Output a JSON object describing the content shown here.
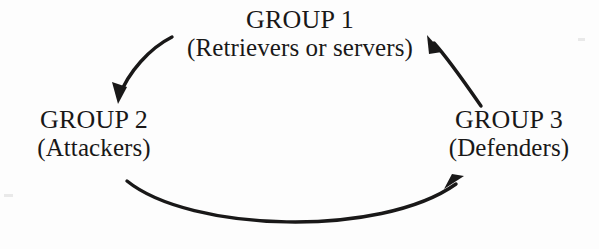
{
  "diagram": {
    "title_semantic": "three-group-cycle-diagram",
    "background_color": "#fdfdfd",
    "ink_color": "#191818",
    "nodes": [
      {
        "id": "group1",
        "title": "GROUP 1",
        "subtitle": "(Retrievers or servers)",
        "position": "top-center"
      },
      {
        "id": "group2",
        "title": "GROUP 2",
        "subtitle": "(Attackers)",
        "position": "left"
      },
      {
        "id": "group3",
        "title": "GROUP 3",
        "subtitle": "(Defenders)",
        "position": "right"
      }
    ],
    "arrows": [
      {
        "id": "arrow-group1-to-group2",
        "from": "group1",
        "to": "group2",
        "label": "",
        "path": "M 172 37 C 150 48 128 72 119 99",
        "tip": [
          118,
          102
        ],
        "head_direction": "down-left"
      },
      {
        "id": "arrow-group2-to-group3",
        "from": "group2",
        "to": "group3",
        "label": "",
        "path": "M 127 181 C 190 232 380 238 459 181",
        "tip": [
          463,
          177
        ],
        "head_direction": "up-right"
      },
      {
        "id": "arrow-group3-to-group1",
        "from": "group3",
        "to": "group1",
        "label": "",
        "path": "M 481 106 C 463 80 445 55 432 41",
        "tip": [
          428,
          36
        ],
        "head_direction": "up-left"
      }
    ]
  }
}
